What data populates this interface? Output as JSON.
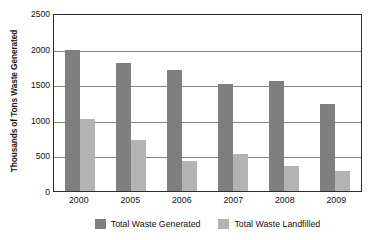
{
  "chart_data": {
    "type": "bar",
    "title": "",
    "xlabel": "",
    "ylabel": "Thousands of Tons Waste Generated",
    "categories": [
      "2000",
      "2005",
      "2006",
      "2007",
      "2008",
      "2009"
    ],
    "series": [
      {
        "name": "Total Waste Generated",
        "color": "#7f7f7f",
        "values": [
          2000,
          1820,
          1720,
          1520,
          1560,
          1230
        ]
      },
      {
        "name": "Total Waste Landfilled",
        "color": "#b3b3b3",
        "values": [
          1020,
          720,
          420,
          530,
          350,
          290
        ]
      }
    ],
    "ylim": [
      0,
      2500
    ],
    "yticks": [
      0,
      500,
      1000,
      1500,
      2000,
      2500
    ],
    "ytick_labels": [
      "0",
      "500",
      "1000",
      "1500",
      "2000",
      "2500"
    ],
    "grid": true,
    "grid_axis": "y",
    "legend_position": "bottom"
  },
  "axis": {
    "y_title": "Thousands of Tons Waste Generated",
    "y_tick_labels": [
      "2500",
      "2000",
      "1500",
      "1000",
      "500",
      "0"
    ],
    "x_tick_labels": [
      "2000",
      "2005",
      "2006",
      "2007",
      "2008",
      "2009"
    ]
  },
  "legend": {
    "entries": [
      {
        "label": "Total Waste Generated",
        "color": "#7f7f7f"
      },
      {
        "label": "Total Waste Landfilled",
        "color": "#b3b3b3"
      }
    ]
  },
  "colors": {
    "generated": "#7f7f7f",
    "landfilled": "#b3b3b3",
    "gridline": "#848484",
    "axis_border": "#2e2e2e",
    "background": "#ffffff",
    "text": "#101010"
  }
}
